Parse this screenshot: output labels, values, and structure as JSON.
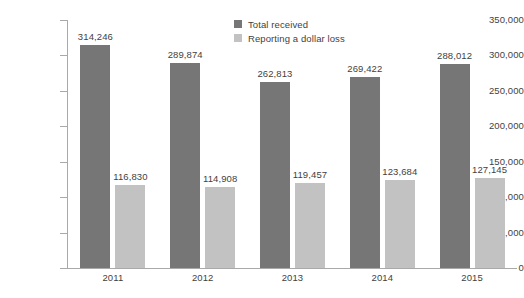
{
  "chart_data": {
    "type": "bar",
    "title": "",
    "subtitle": "",
    "xlabel": "",
    "ylabel": "",
    "categories": [
      "2011",
      "2012",
      "2013",
      "2014",
      "2015"
    ],
    "series": [
      {
        "name": "Total received",
        "color": "#767676",
        "values": [
          314246,
          289874,
          262813,
          269422,
          288012
        ],
        "labels": [
          "314,246",
          "289,874",
          "262,813",
          "269,422",
          "288,012"
        ]
      },
      {
        "name": "Reporting a dollar loss",
        "color": "#c2c2c2",
        "values": [
          116830,
          114908,
          119457,
          123684,
          127145
        ],
        "labels": [
          "116,830",
          "114,908",
          "119,457",
          "123,684",
          "127,145"
        ]
      }
    ],
    "ylim": [
      0,
      350000
    ],
    "ytick_values": [
      0,
      50000,
      100000,
      150000,
      200000,
      250000,
      300000,
      350000
    ],
    "ytick_labels": [
      "0",
      "50,000",
      "100,000",
      "150,000",
      "200,000",
      "250,000",
      "300,000",
      "350,000"
    ],
    "grid": false,
    "legend_position": "top-center",
    "axis_color": "#a9a9a9",
    "text_color": "#3f3f3f",
    "background": "#ffffff"
  },
  "legend": {
    "items": [
      {
        "label": "Total received",
        "color": "#767676",
        "swatch": "legend-swatch-total-received"
      },
      {
        "label": "Reporting a dollar loss",
        "color": "#c2c2c2",
        "swatch": "legend-swatch-dollar-loss"
      }
    ]
  }
}
